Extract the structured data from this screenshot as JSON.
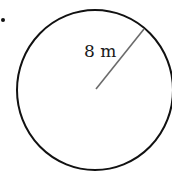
{
  "diagram": {
    "shape": "circle",
    "radius_label": "8 m",
    "bullet": "•",
    "colors": {
      "outline": "#111111",
      "radius_line": "#6b6b6b",
      "text": "#1a1a1a"
    }
  }
}
